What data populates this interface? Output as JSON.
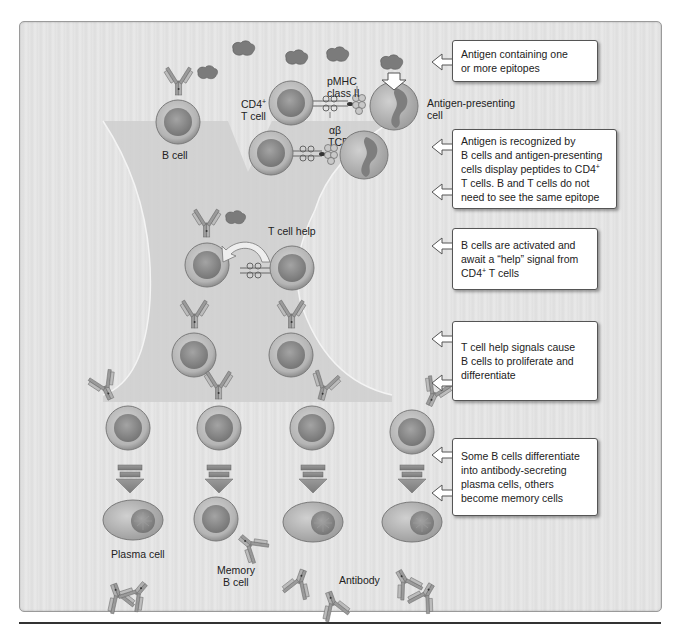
{
  "figure": {
    "colors": {
      "background": "#e3e3e3",
      "funnel": "#d2d2d2",
      "cell_outer": "#bdbdbd",
      "cell_nucleus": "#8c8c8c",
      "callout_fill": "#ffffff",
      "callout_border": "#555555"
    }
  },
  "labels": {
    "b_cell": "B cell",
    "cd4_t_cell_line1": "CD4",
    "cd4_t_cell_sup": "+",
    "cd4_t_cell_line2": "T cell",
    "pmhc_line1": "pMHC",
    "pmhc_line2": "class II",
    "tcr_line1": "αβ",
    "tcr_line2": "TCR",
    "apc_line1": "Antigen-presenting",
    "apc_line2": "cell",
    "t_cell_help": "T cell help",
    "plasma_cell": "Plasma cell",
    "memory_line1": "Memory",
    "memory_line2": "B cell",
    "antibody": "Antibody"
  },
  "callouts": [
    {
      "id": "antigen",
      "lines": [
        "Antigen containing one",
        "or more epitopes"
      ]
    },
    {
      "id": "recognition",
      "lines": [
        "Antigen is recognized by",
        "B cells and antigen-presenting",
        "cells display peptides to CD4",
        "T cells. B and T cells do not",
        "need to see the same epitope"
      ],
      "sup_after_line3": "+"
    },
    {
      "id": "activation",
      "lines": [
        "B cells are activated and",
        "await a “help” signal from",
        "CD4",
        " T cells"
      ],
      "sup": "+"
    },
    {
      "id": "proliferation",
      "lines": [
        "T cell help signals cause",
        "B cells to proliferate and",
        "differentiate"
      ]
    },
    {
      "id": "differentiation",
      "lines": [
        "Some B cells differentiate",
        "into antibody-secreting",
        "plasma cells, others",
        "become memory cells"
      ]
    }
  ]
}
